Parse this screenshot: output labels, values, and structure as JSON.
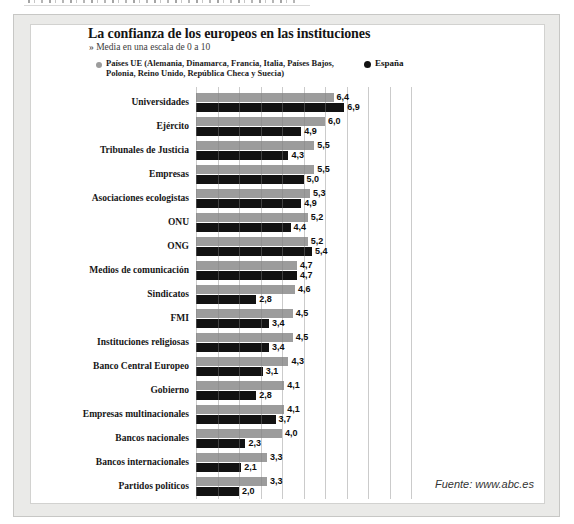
{
  "panel": {
    "title": "La confianza de los europeos en las instituciones",
    "subtitle": "» Media en una escala de 0 a 10",
    "source": "Fuente: www.abc.es"
  },
  "legend": {
    "ue_label_line1": "Países UE (Alemania, Dinamarca, Francia, Italia, Países Bajos,",
    "ue_label_line2": "Polonia, Reino Unido, República Checa y Suecia)",
    "espana_label": "España",
    "ue_color": "#9c9c9c",
    "espana_color": "#121212"
  },
  "chart_data": {
    "type": "bar",
    "orientation": "horizontal",
    "title": "La confianza de los europeos en las instituciones",
    "subtitle": "Media en una escala de 0 a 10",
    "xlim": [
      0,
      10
    ],
    "gridline_step": 1,
    "grid": true,
    "value_label_format": "decimal-comma",
    "categories": [
      "Universidades",
      "Ejército",
      "Tribunales de Justicia",
      "Empresas",
      "Asociaciones ecologistas",
      "ONU",
      "ONG",
      "Medios de comunicación",
      "Sindicatos",
      "FMI",
      "Instituciones religiosas",
      "Banco Central Europeo",
      "Gobierno",
      "Empresas multinacionales",
      "Bancos nacionales",
      "Bancos internacionales",
      "Partidos políticos"
    ],
    "series": [
      {
        "name": "Países UE (Alemania, Dinamarca, Francia, Italia, Países Bajos, Polonia, Reino Unido, República Checa y Suecia)",
        "color": "#9c9c9c",
        "values": [
          6.4,
          6.0,
          5.5,
          5.5,
          5.3,
          5.2,
          5.2,
          4.7,
          4.6,
          4.5,
          4.5,
          4.3,
          4.1,
          4.1,
          4.0,
          3.3,
          3.3
        ]
      },
      {
        "name": "España",
        "color": "#121212",
        "values": [
          6.9,
          4.9,
          4.3,
          5.0,
          4.9,
          4.4,
          5.4,
          4.7,
          2.8,
          3.4,
          3.4,
          3.1,
          2.8,
          3.7,
          2.3,
          2.1,
          2.0
        ]
      }
    ]
  }
}
